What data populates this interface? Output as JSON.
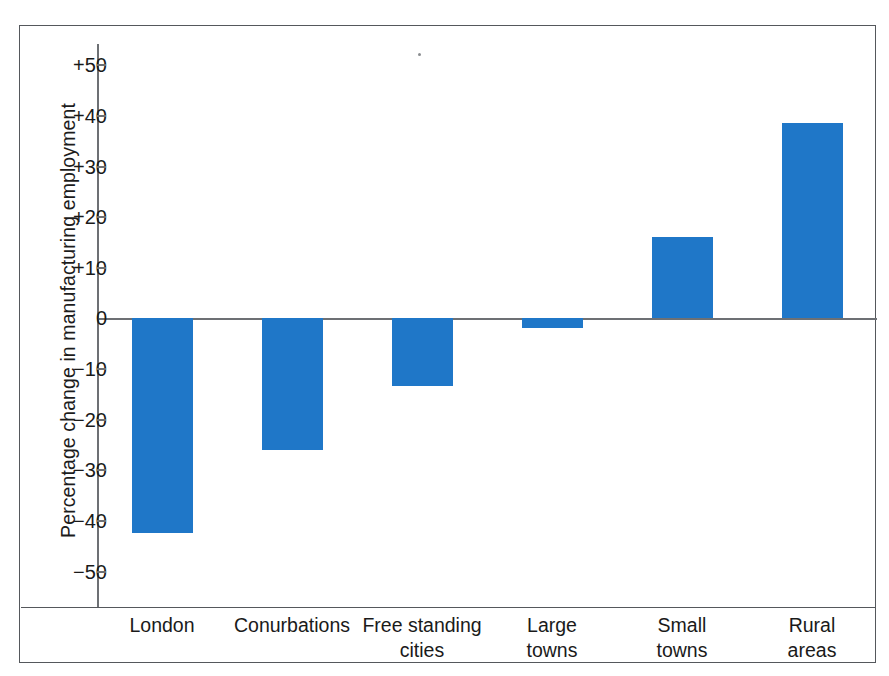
{
  "chart_data": {
    "type": "bar",
    "title": "",
    "xlabel": "",
    "ylabel": "Percentage change in manufacturing employment",
    "categories": [
      "London",
      "Conurbations",
      "Free standing cities",
      "Large towns",
      "Small towns",
      "Rural areas"
    ],
    "values": [
      -42.5,
      -26.0,
      -13.5,
      -2.0,
      16.0,
      38.5
    ],
    "ylim": [
      -57,
      57
    ],
    "yticks": [
      50,
      40,
      30,
      20,
      10,
      0,
      -10,
      -20,
      -30,
      -40,
      -50
    ],
    "ytick_labels": [
      "+50",
      "+40",
      "+30",
      "+20",
      "+10",
      "0",
      "−10",
      "−20",
      "−30",
      "−40",
      "−50"
    ],
    "grid": false,
    "legend": null,
    "bar_color": "#1f77c8",
    "axis_color": "#6d7074",
    "frame_color": "#55585c"
  },
  "axis": {
    "y_title": "Percentage change in manufacturing employment"
  },
  "categories": [
    {
      "label": "London",
      "value": -42.5
    },
    {
      "label": "Conurbations",
      "value": -26.0
    },
    {
      "label": "Free standing\ncities",
      "value": -13.5
    },
    {
      "label": "Large\ntowns",
      "value": -2.0
    },
    {
      "label": "Small\ntowns",
      "value": 16.0
    },
    {
      "label": "Rural\nareas",
      "value": 38.5
    }
  ],
  "ticks": [
    {
      "label": "+50"
    },
    {
      "label": "+40"
    },
    {
      "label": "+30"
    },
    {
      "label": "+20"
    },
    {
      "label": "+10"
    },
    {
      "label": "0"
    },
    {
      "label": "−10"
    },
    {
      "label": "−20"
    },
    {
      "label": "−30"
    },
    {
      "label": "−40"
    },
    {
      "label": "−50"
    }
  ]
}
